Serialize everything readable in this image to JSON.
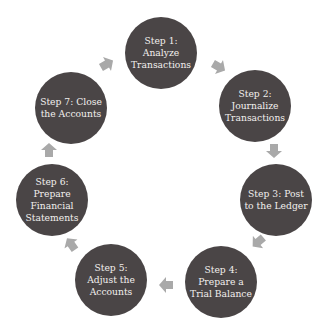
{
  "diagram": {
    "type": "cycle",
    "colors": {
      "node": "#4a4546",
      "node_text": "#f2f0ee",
      "arrow": "#a9a9a9",
      "background": "#ffffff"
    },
    "nodes": [
      {
        "id": "step1",
        "label": "Step 1: Analyze Transactions",
        "cx": 161,
        "cy": 53
      },
      {
        "id": "step2",
        "label": "Step 2: Journalize Transactions",
        "cx": 255,
        "cy": 106
      },
      {
        "id": "step3",
        "label": "Step 3: Post to the Ledger",
        "cx": 276,
        "cy": 200
      },
      {
        "id": "step4",
        "label": "Step 4: Prepare a Trial Balance",
        "cx": 221,
        "cy": 282
      },
      {
        "id": "step5",
        "label": "Step 5: Adjust the Accounts",
        "cx": 111,
        "cy": 280
      },
      {
        "id": "step6",
        "label": "Step 6: Prepare Financial Statements",
        "cx": 52,
        "cy": 200
      },
      {
        "id": "step7",
        "label": "Step 7: Close the Accounts",
        "cx": 71,
        "cy": 108
      }
    ],
    "edges": [
      {
        "from": "step1",
        "to": "step2",
        "x": 219,
        "y": 67,
        "rotate": 30
      },
      {
        "from": "step2",
        "to": "step3",
        "x": 274,
        "y": 151,
        "rotate": 90
      },
      {
        "from": "step3",
        "to": "step4",
        "x": 258,
        "y": 242,
        "rotate": 140
      },
      {
        "from": "step4",
        "to": "step5",
        "x": 166,
        "y": 285,
        "rotate": 180
      },
      {
        "from": "step5",
        "to": "step6",
        "x": 71,
        "y": 244,
        "rotate": 235
      },
      {
        "from": "step6",
        "to": "step7",
        "x": 49,
        "y": 150,
        "rotate": 270
      },
      {
        "from": "step7",
        "to": "step1",
        "x": 107,
        "y": 64,
        "rotate": 330
      }
    ]
  }
}
